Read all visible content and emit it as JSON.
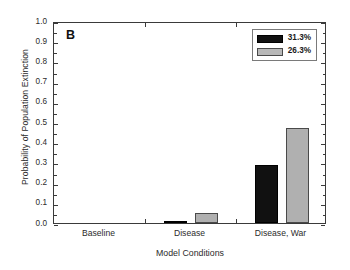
{
  "panel": {
    "label": "B"
  },
  "chart_data": {
    "type": "bar",
    "title": "",
    "xlabel": "Model Conditions",
    "ylabel": "Probability of Population Extinction",
    "categories": [
      "Baseline",
      "Disease",
      "Disease, War"
    ],
    "series": [
      {
        "name": "31.3%",
        "color": "#111111",
        "values": [
          0.0,
          0.01,
          0.285
        ]
      },
      {
        "name": "26.3%",
        "color": "#b0b0b0",
        "values": [
          0.0,
          0.05,
          0.47
        ]
      }
    ],
    "ylim": [
      0.0,
      1.0
    ],
    "ytick_labels": [
      "0.0",
      "0.1",
      "0.2",
      "0.3",
      "0.4",
      "0.5",
      "0.6",
      "0.7",
      "0.8",
      "0.9",
      "1.0"
    ],
    "ytick_values": [
      0.0,
      0.1,
      0.2,
      0.3,
      0.4,
      0.5,
      0.6,
      0.7,
      0.8,
      0.9,
      1.0
    ],
    "grid": false,
    "legend_position": "top-right",
    "frame": "box"
  },
  "legend": {
    "entries": [
      {
        "label": "31.3%",
        "swatch": "black"
      },
      {
        "label": "26.3%",
        "swatch": "gray"
      }
    ]
  }
}
